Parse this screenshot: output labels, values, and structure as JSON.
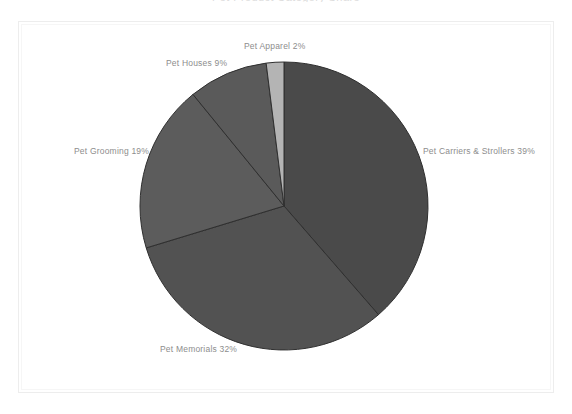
{
  "chart_title": "Pet Product Category Share",
  "frame": {
    "border_color": "#ededed"
  },
  "chart_data": {
    "type": "pie",
    "title": "Pet Product Category Share",
    "xlabel": "",
    "ylabel": "",
    "legend_position": "none",
    "grid": false,
    "start_angle_deg": 0,
    "direction": "clockwise",
    "center": {
      "x": 284,
      "y": 206
    },
    "radius": 144,
    "categories": [
      "Pet Carriers & Strollers",
      "Pet Memorials",
      "Pet Grooming",
      "Pet Houses",
      "Pet Apparel"
    ],
    "values": [
      39,
      32,
      19,
      9,
      2
    ],
    "unit": "%",
    "colors": [
      "#4a4a4a",
      "#525252",
      "#5c5c5c",
      "#5a5a5a",
      "#b4b4b4"
    ],
    "slice_edge_color": "#2f2f2f",
    "slices": [
      {
        "name": "Pet Carriers & Strollers",
        "value": 39,
        "label": "Pet Carriers & Strollers 39%",
        "color": "#4a4a4a"
      },
      {
        "name": "Pet Memorials",
        "value": 32,
        "label": "Pet Memorials 32%",
        "color": "#525252"
      },
      {
        "name": "Pet Grooming",
        "value": 19,
        "label": "Pet Grooming 19%",
        "color": "#5c5c5c"
      },
      {
        "name": "Pet Houses",
        "value": 9,
        "label": "Pet Houses 9%",
        "color": "#5a5a5a"
      },
      {
        "name": "Pet Apparel",
        "value": 2,
        "label": "Pet Apparel 2%",
        "color": "#b4b4b4"
      }
    ],
    "label_color": "#8d8d8d"
  }
}
